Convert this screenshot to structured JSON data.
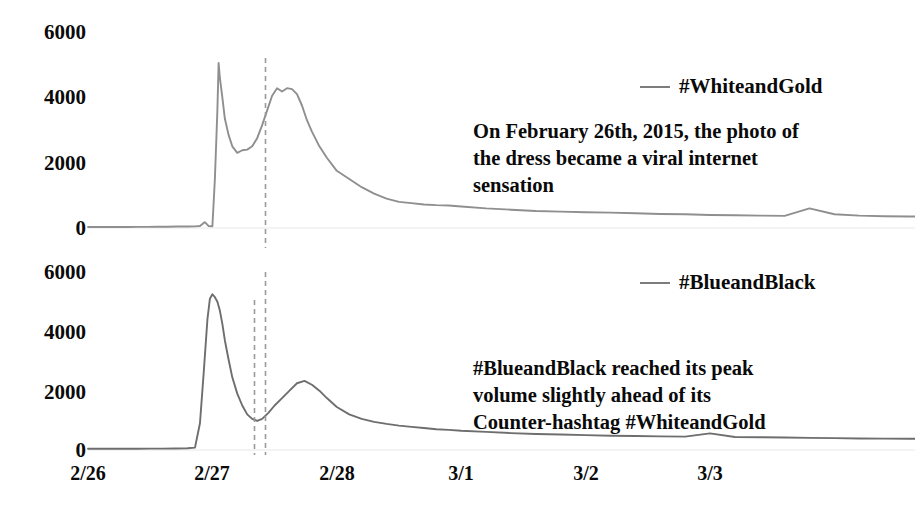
{
  "chart_data": {
    "type": "line",
    "title": "",
    "subtitle": "",
    "xlabel": "",
    "ylabel": "",
    "grid": false,
    "legend_position": "right-inside",
    "panels": [
      {
        "name": "top-panel",
        "series_name": "#WhiteandGold",
        "color": "#8f8f8f",
        "ylim": [
          0,
          6000
        ],
        "yticks": [
          "6000",
          "4000",
          "2000",
          "0"
        ],
        "ytick_values": [
          6000,
          4000,
          2000,
          0
        ],
        "peak_value": 5050,
        "peak_time": "2/27",
        "marker_lines": [
          "2/27 peak of #WhiteandGold"
        ],
        "x": [
          0.0,
          0.08,
          0.16,
          0.24,
          0.32,
          0.4,
          0.48,
          0.56,
          0.64,
          0.72,
          0.8,
          0.86,
          0.9,
          0.94,
          0.97,
          1.0,
          1.02,
          1.04,
          1.05,
          1.06,
          1.08,
          1.1,
          1.13,
          1.16,
          1.2,
          1.24,
          1.28,
          1.32,
          1.36,
          1.4,
          1.44,
          1.48,
          1.52,
          1.56,
          1.6,
          1.64,
          1.68,
          1.72,
          1.76,
          1.8,
          1.86,
          1.92,
          2.0,
          2.1,
          2.2,
          2.3,
          2.4,
          2.5,
          2.6,
          2.7,
          2.8,
          2.9,
          3.0,
          3.2,
          3.4,
          3.6,
          3.8,
          4.0,
          4.2,
          4.4,
          4.6,
          4.8,
          5.0,
          5.2,
          5.4,
          5.6,
          5.8,
          6.0,
          6.2,
          6.4,
          6.6
        ],
        "y": [
          30,
          30,
          30,
          30,
          30,
          35,
          35,
          40,
          40,
          45,
          45,
          50,
          60,
          180,
          60,
          55,
          1500,
          3600,
          5050,
          4600,
          4000,
          3350,
          2850,
          2500,
          2300,
          2380,
          2400,
          2500,
          2750,
          3150,
          3600,
          4050,
          4280,
          4180,
          4280,
          4250,
          4100,
          3750,
          3300,
          2950,
          2500,
          2150,
          1750,
          1500,
          1250,
          1050,
          900,
          800,
          760,
          720,
          700,
          690,
          660,
          600,
          560,
          520,
          500,
          480,
          470,
          450,
          430,
          420,
          400,
          390,
          380,
          370,
          600,
          420,
          380,
          360,
          350
        ]
      },
      {
        "name": "bottom-panel",
        "series_name": "#BlueandBlack",
        "color": "#6e6e6e",
        "ylim": [
          0,
          6000
        ],
        "yticks": [
          "6000",
          "4000",
          "2000",
          "0"
        ],
        "ytick_values": [
          6000,
          4000,
          2000,
          0
        ],
        "peak_value": 5250,
        "peak_time": "2/27",
        "marker_lines": [
          "2/27 peak of #BlueandBlack",
          "2/27 peak of #WhiteandGold"
        ],
        "x": [
          0.0,
          0.1,
          0.2,
          0.3,
          0.4,
          0.5,
          0.6,
          0.7,
          0.8,
          0.86,
          0.9,
          0.93,
          0.96,
          0.98,
          1.0,
          1.02,
          1.04,
          1.06,
          1.08,
          1.1,
          1.13,
          1.16,
          1.2,
          1.24,
          1.28,
          1.32,
          1.36,
          1.4,
          1.45,
          1.5,
          1.56,
          1.62,
          1.68,
          1.74,
          1.8,
          1.86,
          1.92,
          2.0,
          2.1,
          2.2,
          2.3,
          2.4,
          2.5,
          2.6,
          2.7,
          2.8,
          2.9,
          3.0,
          3.2,
          3.4,
          3.6,
          3.8,
          4.0,
          4.2,
          4.4,
          4.6,
          4.8,
          5.0,
          5.2,
          5.4,
          5.6,
          5.8,
          6.0,
          6.2,
          6.4,
          6.6
        ],
        "y": [
          40,
          40,
          40,
          40,
          40,
          45,
          45,
          50,
          60,
          80,
          900,
          2600,
          4400,
          5100,
          5250,
          5150,
          5000,
          4700,
          4250,
          3700,
          3050,
          2450,
          1900,
          1500,
          1200,
          1050,
          980,
          1050,
          1250,
          1500,
          1750,
          2000,
          2250,
          2330,
          2200,
          2000,
          1750,
          1450,
          1200,
          1050,
          950,
          880,
          820,
          780,
          740,
          700,
          680,
          650,
          610,
          570,
          540,
          520,
          500,
          480,
          470,
          460,
          450,
          560,
          440,
          430,
          420,
          410,
          400,
          390,
          385,
          380
        ]
      }
    ],
    "xticks": [
      "2/26",
      "2/27",
      "2/28",
      "3/1",
      "3/2",
      "3/3"
    ],
    "annotations": [
      {
        "name": "annotation-whiteandgold",
        "text": "On February 26th, 2015, the photo of\nthe dress became a viral internet\nsensation"
      },
      {
        "name": "annotation-blueandblack",
        "text": "#BlueandBlack reached its peak\nvolume slightly ahead of its\nCounter-hashtag #WhiteandGold"
      }
    ]
  },
  "colors": {
    "whiteandgold_line": "#8f8f8f",
    "blueandblack_line": "#6e6e6e",
    "text": "#0a0a0a",
    "dashed_marker": "#9a9a9a",
    "background": "#ffffff"
  }
}
